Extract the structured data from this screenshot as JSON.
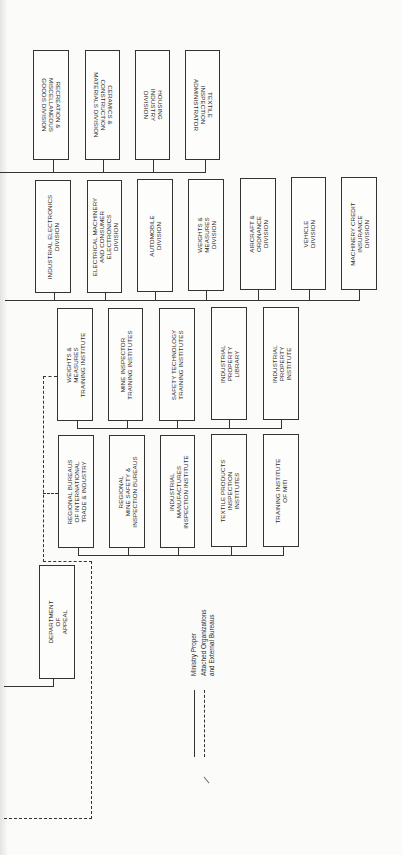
{
  "chart": {
    "top_row": [
      {
        "label": "RECREATION &\nMISCELLANEOUS\nGOODS DIVISION"
      },
      {
        "label": "CERAMICS &\nCONSTRUCTION\nMATERIALS DIVISION"
      },
      {
        "label": "HOUSING\nINDUSTRY\nDIVISION"
      },
      {
        "label": "TEXTILE\nINSPECTION\nADMINISTRATOR"
      }
    ],
    "divisions": [
      {
        "label": "INDUSTRIAL ELECTRONICS\nDIVISION"
      },
      {
        "label": "ELECTRICAL MACHINERY\nAND CONSUMER\nELECTRONICS\nDIVISION"
      },
      {
        "label": "AUTOMOBILE\nDIVISION"
      },
      {
        "label": "WEIGHTS &\nMEASURES\nDIVISION"
      },
      {
        "label": "AIRCRAFT &\nORDNANCE\nDIVISION"
      },
      {
        "label": "VEHICLE\nDIVISION"
      },
      {
        "label": "MACHINERY CREDIT\nINSURANCE\nDIVISION"
      }
    ],
    "institutes": [
      {
        "label": "WEIGHTS &\nMEASURES\nTRAINING INSTITUTE"
      },
      {
        "label": "MINE INSPECTOR\nTRAINING INSTITUTES"
      },
      {
        "label": "SAFETY TECHNOLOGY\nTRAINING INSTITUTES"
      },
      {
        "label": "INDUSTRIAL\nPROPERTY\nLIBRARY"
      },
      {
        "label": "INDUSTRIAL\nPROPERTY\nINSTITUTE"
      }
    ],
    "bureaus": [
      {
        "label": "REGIONAL BUREAUS\nOF INTERNATIONAL\nTRADE & INDUSTRY"
      },
      {
        "label": "REGIONAL\nMINE SAFETY &\nINSPECTION BUREAUS"
      },
      {
        "label": "INDUSTRIAL\nMANUFACTURES\nINSPECTION INSTITUTE"
      },
      {
        "label": "TEXTILE PRODUCTS\nINSPECTION\nINSTITUTES"
      },
      {
        "label": "TRAINING INSTITUTE\nOF MITI"
      }
    ],
    "department": {
      "label": "DEPARTMENT\nOF\nAPPEAL"
    },
    "legend": {
      "solid": "Ministry Proper",
      "dashed": "Attached Organizations\nand External Bureaus"
    }
  }
}
